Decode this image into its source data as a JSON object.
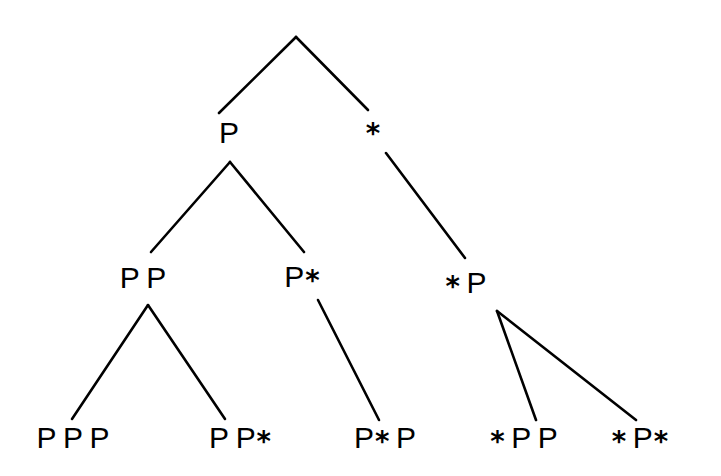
{
  "figure": {
    "name": "binary-derivation-tree",
    "background_color": "#ffffff",
    "stroke_color": "#000000",
    "width": 721,
    "height": 476
  },
  "symbols": {
    "nonterminal": "P",
    "terminal": "*"
  },
  "nodes": [
    {
      "id": "root",
      "text": "",
      "tokens": [],
      "x": 296,
      "y": 36,
      "font_size": 30,
      "level": 0
    },
    {
      "id": "n-l1-left",
      "text": "P",
      "tokens": [
        "P"
      ],
      "x": 229,
      "y": 133,
      "font_size": 30,
      "level": 1
    },
    {
      "id": "n-l1-right",
      "text": "*",
      "tokens": [
        "*"
      ],
      "x": 373,
      "y": 130,
      "font_size": 30,
      "level": 1
    },
    {
      "id": "n-l2-a",
      "text": "P P",
      "tokens": [
        "P",
        "P"
      ],
      "x": 143,
      "y": 278,
      "font_size": 30,
      "level": 2
    },
    {
      "id": "n-l2-b",
      "text": "P*",
      "tokens": [
        "P",
        "*"
      ],
      "x": 302,
      "y": 277,
      "font_size": 30,
      "level": 2
    },
    {
      "id": "n-l2-c",
      "text": "* P",
      "tokens": [
        "*",
        "P"
      ],
      "x": 466,
      "y": 283,
      "font_size": 30,
      "level": 2
    },
    {
      "id": "n-l3-a",
      "text": "P P P",
      "tokens": [
        "P",
        "P",
        "P"
      ],
      "x": 73,
      "y": 438,
      "font_size": 30,
      "level": 3
    },
    {
      "id": "n-l3-b",
      "text": "P P *",
      "tokens": [
        "P",
        "P",
        "*"
      ],
      "x": 240,
      "y": 438,
      "font_size": 30,
      "level": 3
    },
    {
      "id": "n-l3-c",
      "text": "P* P",
      "tokens": [
        "P",
        "*",
        "P"
      ],
      "x": 385,
      "y": 438,
      "font_size": 30,
      "level": 3
    },
    {
      "id": "n-l3-d",
      "text": "* P P",
      "tokens": [
        "*",
        "P",
        "P"
      ],
      "x": 524,
      "y": 438,
      "font_size": 30,
      "level": 3
    },
    {
      "id": "n-l3-e",
      "text": "* P *",
      "tokens": [
        "*",
        "P",
        "*"
      ],
      "x": 640,
      "y": 438,
      "font_size": 30,
      "level": 3
    }
  ],
  "edges": [
    {
      "id": "edge-root-left",
      "from": "root",
      "to": "n-l1-left",
      "x1": 296,
      "y1": 37,
      "x2": 219,
      "y2": 113
    },
    {
      "id": "edge-root-right",
      "from": "root",
      "to": "n-l1-right",
      "x1": 296,
      "y1": 37,
      "x2": 368,
      "y2": 110
    },
    {
      "id": "edge-l1left-a",
      "from": "n-l1-left",
      "to": "n-l2-a",
      "x1": 230,
      "y1": 162,
      "x2": 151,
      "y2": 252
    },
    {
      "id": "edge-l1left-b",
      "from": "n-l1-left",
      "to": "n-l2-b",
      "x1": 230,
      "y1": 162,
      "x2": 304,
      "y2": 252
    },
    {
      "id": "edge-l1right-c",
      "from": "n-l1-right",
      "to": "n-l2-c",
      "x1": 386,
      "y1": 153,
      "x2": 465,
      "y2": 258
    },
    {
      "id": "edge-l2a-left",
      "from": "n-l2-a",
      "to": "n-l3-a",
      "x1": 148,
      "y1": 305,
      "x2": 72,
      "y2": 419
    },
    {
      "id": "edge-l2a-right",
      "from": "n-l2-a",
      "to": "n-l3-b",
      "x1": 148,
      "y1": 305,
      "x2": 225,
      "y2": 419
    },
    {
      "id": "edge-l2b-down",
      "from": "n-l2-b",
      "to": "n-l3-c",
      "x1": 318,
      "y1": 300,
      "x2": 379,
      "y2": 420
    },
    {
      "id": "edge-l2c-left",
      "from": "n-l2-c",
      "to": "n-l3-d",
      "x1": 497,
      "y1": 311,
      "x2": 536,
      "y2": 420
    },
    {
      "id": "edge-l2c-right",
      "from": "n-l2-c",
      "to": "n-l3-e",
      "x1": 497,
      "y1": 311,
      "x2": 636,
      "y2": 420
    }
  ],
  "stroke_width": 2.6
}
